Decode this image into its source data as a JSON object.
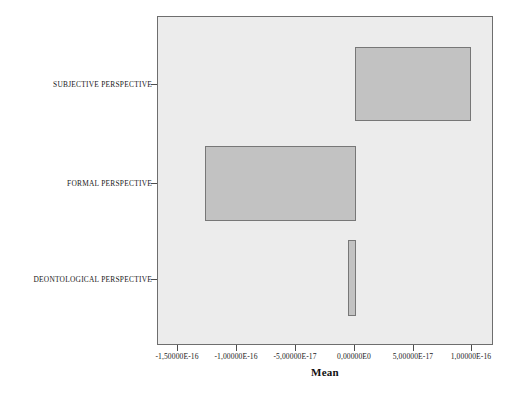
{
  "chart_data": {
    "type": "bar",
    "orientation": "horizontal",
    "title": "",
    "xlabel": "Mean",
    "ylabel": "",
    "grid": false,
    "legend": null,
    "xlim": [
      -1.75e-16,
      1.25e-16
    ],
    "xticks": [
      -1.5e-16,
      -1e-16,
      -5e-17,
      0.0,
      5e-17,
      1e-16
    ],
    "xtick_labels": [
      "-1,50000E-16",
      "-1,00000E-16",
      "-5,00000E-17",
      "0,00000E0",
      "5,00000E-17",
      "1,00000E-16"
    ],
    "categories": [
      "SUBJECTIVE PERSPECTIVE",
      "FORMAL PERSPECTIVE",
      "DEONTOLOGICAL PERSPECTIVE"
    ],
    "values": [
      9.9e-17,
      -1.27e-16,
      -6e-18
    ],
    "value_labels": [
      "9,90000E-17",
      "-1,27000E-16",
      "-6,00000E-18"
    ],
    "bar_fill": "#c2c2c2",
    "bar_border": "#777777",
    "plot_background": "#ececec",
    "plot_border": "#6e6e6e",
    "page_background": "#ffffff"
  },
  "axis": {
    "x_title": "Mean"
  },
  "bars": [
    {
      "name": "subjective-perspective",
      "label": "SUBJECTIVE PERSPECTIVE",
      "value": 9.9e-17,
      "left_px": 355,
      "top_px": 47,
      "width_px": 116,
      "height_px": 74,
      "center_y_px": 84
    },
    {
      "name": "formal-perspective",
      "label": "FORMAL PERSPECTIVE",
      "value": -1.27e-16,
      "left_px": 205,
      "top_px": 146,
      "width_px": 151,
      "height_px": 75,
      "center_y_px": 183
    },
    {
      "name": "deontological-perspective",
      "label": "DEONTOLOGICAL PERSPECTIVE",
      "value": -6e-18,
      "left_px": 348,
      "top_px": 240,
      "width_px": 8,
      "height_px": 76,
      "center_y_px": 279
    }
  ],
  "xticks": [
    {
      "label": "-1,50000E-16",
      "x_px": 177
    },
    {
      "label": "-1,00000E-16",
      "x_px": 236
    },
    {
      "label": "-5,00000E-17",
      "x_px": 295
    },
    {
      "label": "0,00000E0",
      "x_px": 354
    },
    {
      "label": "5,00000E-17",
      "x_px": 413
    },
    {
      "label": "1,00000E-16",
      "x_px": 471
    }
  ]
}
